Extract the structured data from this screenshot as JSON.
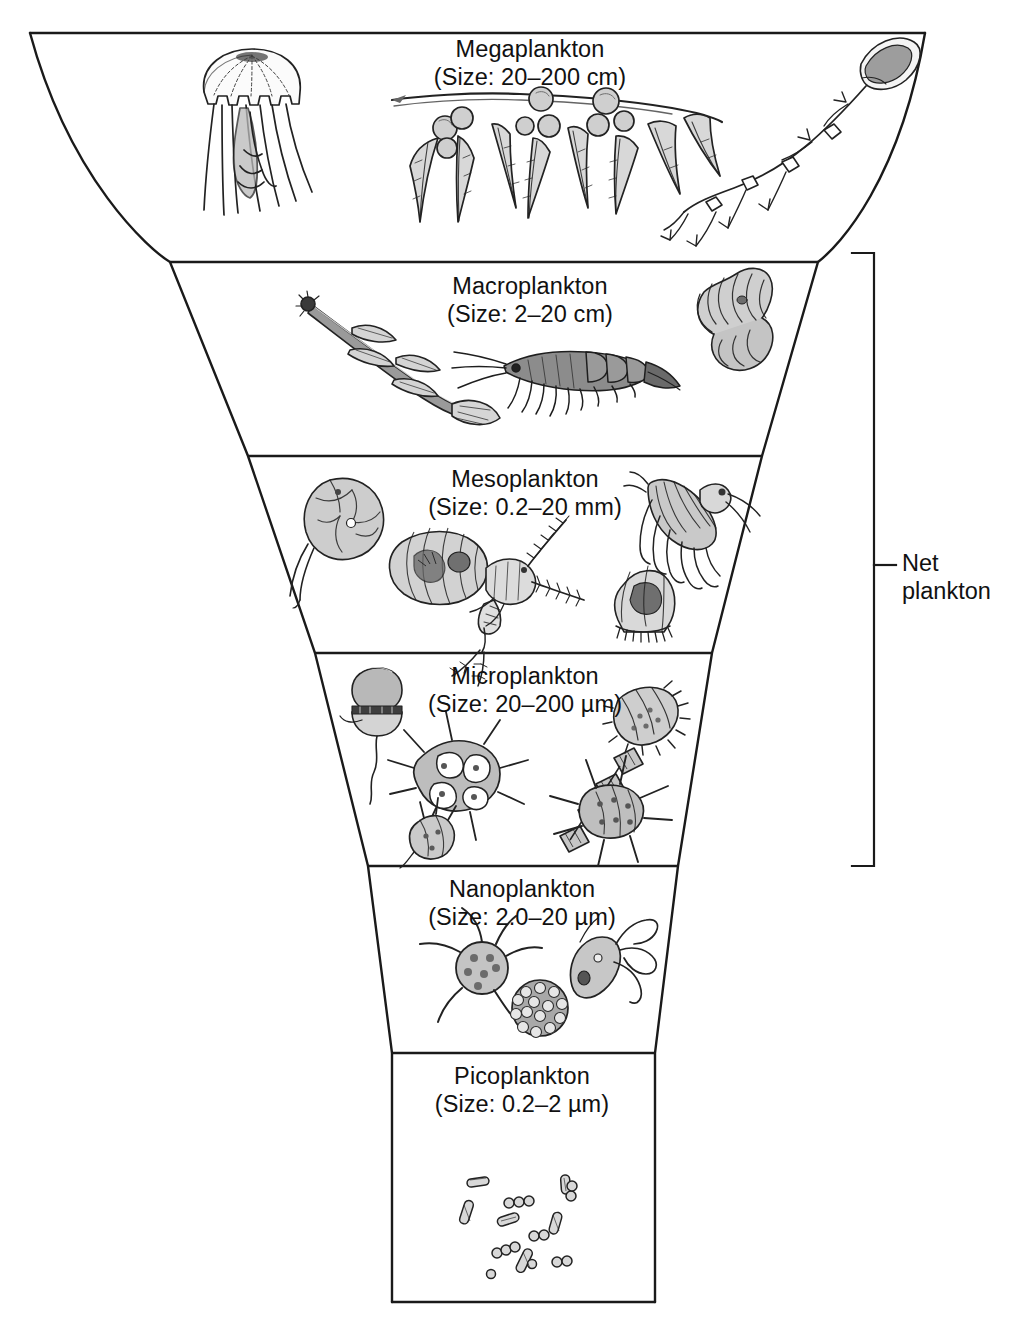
{
  "figure": {
    "background": "#ffffff",
    "line_color": "#1a1a1a",
    "fill_color": "#ffffff"
  },
  "sections": [
    {
      "id": "megaplankton",
      "name": "Megaplankton",
      "size": "(Size: 20–200 cm)",
      "label_x": 530,
      "label_y": 36,
      "organisms": [
        "jellyfish",
        "sargassum-seaweed",
        "siphonophore"
      ]
    },
    {
      "id": "macroplankton",
      "name": "Macroplankton",
      "size": "(Size: 2–20 cm)",
      "label_x": 530,
      "label_y": 273,
      "organisms": [
        "arrow-worm",
        "krill",
        "salp"
      ]
    },
    {
      "id": "mesoplankton",
      "name": "Mesoplankton",
      "size": "(Size: 0.2–20 mm)",
      "label_x": 525,
      "label_y": 466,
      "organisms": [
        "larvacean",
        "ostracod",
        "copepod",
        "amphipod",
        "larva"
      ]
    },
    {
      "id": "microplankton",
      "name": "Microplankton",
      "size": "(Size: 20–200 µm)",
      "label_x": 525,
      "label_y": 663,
      "organisms": [
        "dinoflagellate",
        "chain-diatom",
        "tintinnid",
        "star-diatom",
        "spiny-diatom",
        "small-dinoflagellate"
      ]
    },
    {
      "id": "nanoplankton",
      "name": "Nanoplankton",
      "size": "(Size: 2.0–20 µm)",
      "label_x": 522,
      "label_y": 876,
      "organisms": [
        "star-coccolithophore",
        "flagellate",
        "coccosphere"
      ]
    },
    {
      "id": "picoplankton",
      "name": "Picoplankton",
      "size": "(Size: 0.2–2 µm)",
      "label_x": 522,
      "label_y": 1063,
      "organisms": [
        "bacteria"
      ]
    }
  ],
  "bracket": {
    "label_line_1": "Net",
    "label_line_2": "plankton",
    "label_x": 902,
    "label_y": 548,
    "top_y": 253,
    "bottom_y": 866,
    "x": 874,
    "tick_y": 565,
    "tick_x_end": 893
  }
}
